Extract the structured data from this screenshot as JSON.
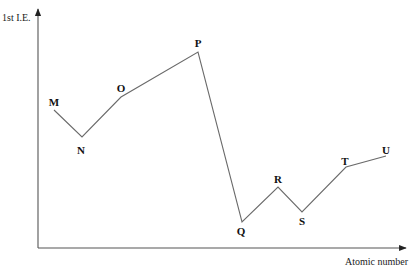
{
  "chart_data": {
    "type": "line",
    "title": "",
    "xlabel": "Atomic number",
    "ylabel": "1st I.E.",
    "grid": false,
    "legend": null,
    "categories": [
      "M",
      "N",
      "O",
      "P",
      "Q",
      "R",
      "S",
      "T",
      "U"
    ],
    "values": [
      138,
      111,
      151,
      196,
      26,
      61,
      36,
      81,
      92
    ],
    "points": [
      {
        "label": "M",
        "px": 54,
        "py": 110,
        "lx": 54,
        "ly": 106
      },
      {
        "label": "N",
        "px": 82,
        "py": 137,
        "lx": 81,
        "ly": 154
      },
      {
        "label": "O",
        "px": 121,
        "py": 97,
        "lx": 121,
        "ly": 92
      },
      {
        "label": "P",
        "px": 198,
        "py": 52,
        "lx": 198,
        "ly": 47
      },
      {
        "label": "Q",
        "px": 242,
        "py": 222,
        "lx": 241,
        "ly": 235
      },
      {
        "label": "R",
        "px": 278,
        "py": 187,
        "lx": 278,
        "ly": 183
      },
      {
        "label": "S",
        "px": 302,
        "py": 212,
        "lx": 302,
        "ly": 225
      },
      {
        "label": "T",
        "px": 346,
        "py": 167,
        "lx": 345,
        "ly": 165
      },
      {
        "label": "U",
        "px": 386,
        "py": 156,
        "lx": 386,
        "ly": 154
      }
    ],
    "axes": {
      "origin": {
        "x": 38,
        "y": 248
      },
      "y_top": 8,
      "x_right": 405,
      "ticks": "none"
    },
    "note": "Qualitative sketch of first ionization energy vs atomic number; no numeric tick values shown. Values are relative heights in pixels above the x-axis."
  },
  "labels": {
    "y_axis": "1st I.E.",
    "x_axis": "Atomic number"
  },
  "colors": {
    "line": "#6a6a6a",
    "axis": "#555555",
    "text": "#111111",
    "background": "#ffffff"
  }
}
